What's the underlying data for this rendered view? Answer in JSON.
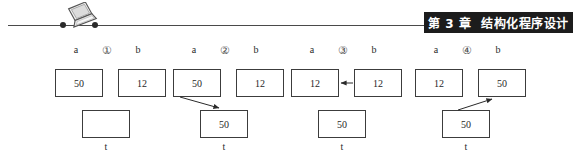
{
  "page": {
    "background": "#ffffff",
    "width": 573,
    "height": 161
  },
  "header": {
    "banner_text_left": "第 3 章",
    "banner_text_right": "结构化程序设计",
    "banner_bg": "#1c1c1c",
    "banner_fg": "#ffffff",
    "rule_color": "#4a4a4a",
    "icon": "laptop-icon"
  },
  "diagram": {
    "type": "variable-swap-trace",
    "t_label": "t",
    "label_a": "a",
    "label_b": "b",
    "box_border": "#3c3c3c",
    "arrow_color": "#2a2a2a",
    "steps": [
      {
        "step_label": "①",
        "a": "50",
        "b": "12",
        "t": "",
        "arrow": "none"
      },
      {
        "step_label": "②",
        "a": "50",
        "b": "12",
        "t": "50",
        "arrow": "a-to-t"
      },
      {
        "step_label": "③",
        "a": "12",
        "b": "12",
        "t": "50",
        "arrow": "b-to-a"
      },
      {
        "step_label": "④",
        "a": "12",
        "b": "50",
        "t": "50",
        "arrow": "t-to-b"
      }
    ]
  }
}
